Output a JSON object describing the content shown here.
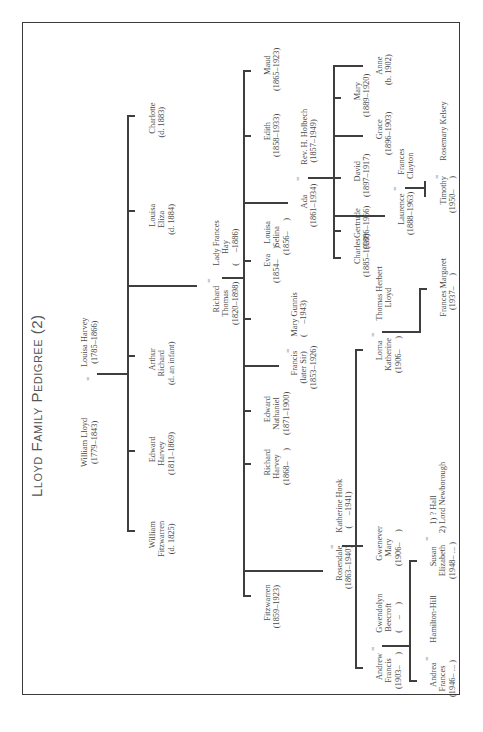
{
  "page": {
    "title": "Lloyd Family Pedigree (2)",
    "orientation": "rotated-90-ccw"
  },
  "colors": {
    "ink": "#444444",
    "lines": "#3e3e3e",
    "frame": "#3a3a3a",
    "paper": "#ffffff"
  },
  "people": {
    "william_lloyd": {
      "name": "William Lloyd",
      "dates": "(1779–1843)"
    },
    "louisa_harvey": {
      "name": "Louisa Harvey",
      "dates": "(1785–1866)"
    },
    "william_fitzwarren": {
      "name": "William\nFitzwarren",
      "dates": "(d. 1825)"
    },
    "edward_harvey": {
      "name": "Edward\nHarvey",
      "dates": "(1811–1869)"
    },
    "arthur_richard": {
      "name": "Arthur\nRichard",
      "dates": "(d. an infant)"
    },
    "richard_thomas": {
      "name": "Richard\nThomas",
      "dates": "(1820–1898)"
    },
    "lady_frances_hay": {
      "name": "Lady Frances\nHay",
      "dates": "(     –1886)"
    },
    "louisa_eliza": {
      "name": "Louisa\nEliza",
      "dates": "(d. 1884)"
    },
    "charlotte": {
      "name": "Charlotte",
      "dates": "(d. 1883)"
    },
    "fitzwarren": {
      "name": "Fitzwarren",
      "dates": "(1859–1923)"
    },
    "rosendale": {
      "name": "Rosendale",
      "dates": "(1863–1940)"
    },
    "katherine_hook": {
      "name": "Katherine Hook",
      "dates": "(     –1941)"
    },
    "richard_harvey": {
      "name": "Richard\nHarvey",
      "dates": "(1868–     )"
    },
    "edward_nathaniel": {
      "name": "Edward\nNathaniel",
      "dates": "(1871–1900)"
    },
    "francis": {
      "name": "Francis\n(later Sir)",
      "dates": "(1853–1926)"
    },
    "mary_gunnis": {
      "name": "Mary Gunnis",
      "dates": "(     –1943)"
    },
    "eva": {
      "name": "Eva",
      "dates": "(1854–     )"
    },
    "louisa_selina": {
      "name": "Louisa\nSelina",
      "dates": "(1856–     )"
    },
    "ada": {
      "name": "Ada",
      "dates": "(1861–1934)"
    },
    "rev_holbech": {
      "name": "Rev. H. Holbech",
      "dates": "(1857–1949)"
    },
    "edith": {
      "name": "Edith",
      "dates": "(1858–1933)"
    },
    "maud": {
      "name": "Maud",
      "dates": "(1865–1923)"
    },
    "andrew_francis": {
      "name": "Andrew\nFrancis",
      "dates": "(1903–     )"
    },
    "gwendolyn_beecroft": {
      "name": "Gwendolyn\nBeecroft",
      "dates": "(     –     )"
    },
    "gwenever_mary": {
      "name": "Gwenever\nMary",
      "dates": "(1906–     )"
    },
    "lorna_katherine": {
      "name": "Lorna\nKatherine",
      "dates": "(1906–     )"
    },
    "thomas_herbert_lloyd": {
      "name": "Thomas Herbert\nLloyd",
      "dates": ""
    },
    "frances_margaret": {
      "name": "Frances Margaret",
      "dates": "(1937–     )"
    },
    "andrea_frances": {
      "name": "Andrea\nFrances",
      "dates": "(1946– ... )"
    },
    "hamilton_hill": {
      "name": "Hamilton-Hill",
      "dates": ""
    },
    "susan_elizabeth": {
      "name": "Susan\nElizabeth",
      "dates": "(1948– ... )"
    },
    "susan_spouses": {
      "name": "1) ? Hall\n2) Lord Newborough",
      "dates": ""
    },
    "charles": {
      "name": "Charles",
      "dates": "(1885–1930)"
    },
    "gertrude": {
      "name": "Gertrude",
      "dates": "(1886–1966)"
    },
    "laurence": {
      "name": "Laurence",
      "dates": "(1888–1963)"
    },
    "frances_clayton": {
      "name": "Frances\nClayton",
      "dates": ""
    },
    "david": {
      "name": "David",
      "dates": "(1897–1917)"
    },
    "grace": {
      "name": "Grace",
      "dates": "(1896–1903)"
    },
    "mary": {
      "name": "Mary",
      "dates": "(1889–1920)"
    },
    "anne": {
      "name": "Anne",
      "dates": "(b. 1902)"
    },
    "timothy": {
      "name": "Timothy",
      "dates": "(1950–     )"
    },
    "rosemary_kelsey": {
      "name": "Rosemary Kelsey",
      "dates": ""
    }
  },
  "marriage_symbol": "="
}
